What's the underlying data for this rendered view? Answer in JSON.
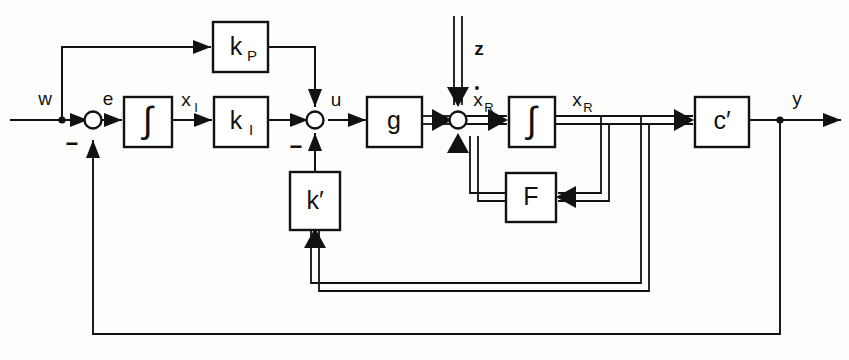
{
  "diagram": {
    "background_color": "#fdfdfb",
    "line_color": "#111111",
    "blocks": [
      {
        "id": "kp",
        "label": "k",
        "sub": "P",
        "kind": "gain"
      },
      {
        "id": "int1",
        "label": "∫",
        "sub": "",
        "kind": "integrator"
      },
      {
        "id": "ki",
        "label": "k",
        "sub": "I",
        "kind": "gain"
      },
      {
        "id": "kprime",
        "label": "k′",
        "sub": "",
        "kind": "gain"
      },
      {
        "id": "g",
        "label": "g",
        "sub": "",
        "kind": "gain"
      },
      {
        "id": "int2",
        "label": "∫",
        "sub": "",
        "kind": "integrator"
      },
      {
        "id": "f",
        "label": "F",
        "sub": "",
        "kind": "matrix"
      },
      {
        "id": "cprime",
        "label": "c′",
        "sub": "",
        "kind": "matrix"
      }
    ],
    "signals": [
      {
        "id": "w",
        "label": "w",
        "sub": "",
        "type": "scalar"
      },
      {
        "id": "e",
        "label": "e",
        "sub": "",
        "type": "scalar"
      },
      {
        "id": "xI",
        "label": "x",
        "sub": "I",
        "type": "scalar"
      },
      {
        "id": "u",
        "label": "u",
        "sub": "",
        "type": "scalar"
      },
      {
        "id": "z",
        "label": "z",
        "sub": "",
        "type": "vector"
      },
      {
        "id": "xRdot",
        "label": "x",
        "sub": "R",
        "type": "vector",
        "dot": true
      },
      {
        "id": "xR",
        "label": "x",
        "sub": "R",
        "type": "vector"
      },
      {
        "id": "y",
        "label": "y",
        "sub": "",
        "type": "scalar"
      }
    ],
    "sum_junctions": [
      {
        "id": "sum-e",
        "negative_sign": "−"
      },
      {
        "id": "sum-u",
        "negative_sign": "−"
      },
      {
        "id": "sum-xRdot",
        "negative_sign": ""
      }
    ],
    "sign_marks": [
      {
        "id": "sign-e",
        "text": "−"
      },
      {
        "id": "sign-u",
        "text": "−"
      }
    ]
  }
}
